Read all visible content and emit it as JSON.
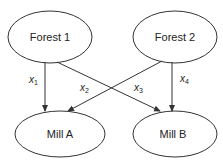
{
  "diagram": {
    "type": "network-flow",
    "nodes": [
      {
        "id": "forest1",
        "label": "Forest 1",
        "cx": 50,
        "cy": 37,
        "rx": 42,
        "ry": 26
      },
      {
        "id": "forest2",
        "label": "Forest 2",
        "cx": 175,
        "cy": 37,
        "rx": 42,
        "ry": 26
      },
      {
        "id": "millA",
        "label": "Mill A",
        "cx": 60,
        "cy": 134,
        "rx": 45,
        "ry": 23
      },
      {
        "id": "millB",
        "label": "Mill B",
        "cx": 175,
        "cy": 134,
        "rx": 42,
        "ry": 23
      }
    ],
    "edges": [
      {
        "id": "x1",
        "from": "forest1",
        "to": "millA",
        "var": "x",
        "sub": "1"
      },
      {
        "id": "x2",
        "from": "forest2",
        "to": "millA",
        "var": "x",
        "sub": "2"
      },
      {
        "id": "x3",
        "from": "forest1",
        "to": "millB",
        "var": "x",
        "sub": "3"
      },
      {
        "id": "x4",
        "from": "forest2",
        "to": "millB",
        "var": "x",
        "sub": "4"
      }
    ],
    "colors": {
      "stroke": "#333333",
      "text": "#222222",
      "background": "#ffffff"
    }
  }
}
